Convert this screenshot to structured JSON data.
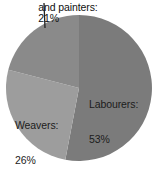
{
  "chart_data": {
    "type": "pie",
    "title": "",
    "subtitle": "",
    "xlabel": "",
    "ylabel": "",
    "legend_position": "none",
    "grid": false,
    "value_unit": "%",
    "categories": [
      "Labourers",
      "Weavers",
      "Carpenters, joiners and painters"
    ],
    "values": [
      53,
      26,
      21
    ],
    "slices": [
      {
        "name": "Labourers",
        "value": 53,
        "label_text": "Labourers:",
        "value_text": "53%",
        "color": "#7b7b7b",
        "start_angle_deg": 0,
        "end_angle_deg": 190.8,
        "label_placement": "inside-right"
      },
      {
        "name": "Weavers",
        "value": 26,
        "label_text": "Weavers:",
        "value_text": "26%",
        "color": "#9d9d9d",
        "start_angle_deg": 190.8,
        "end_angle_deg": 284.4,
        "label_placement": "inside-left"
      },
      {
        "name": "Carpenters, joiners and painters",
        "value": 21,
        "label_text": "and painters:",
        "value_text": "21%",
        "color": "#8a8a8a",
        "start_angle_deg": 284.4,
        "end_angle_deg": 360,
        "label_placement": "callout-top",
        "label_truncated_at_image_edge": true
      }
    ]
  },
  "callout": {
    "line_color": "#222222"
  },
  "background": {
    "color": "#ffffff"
  }
}
